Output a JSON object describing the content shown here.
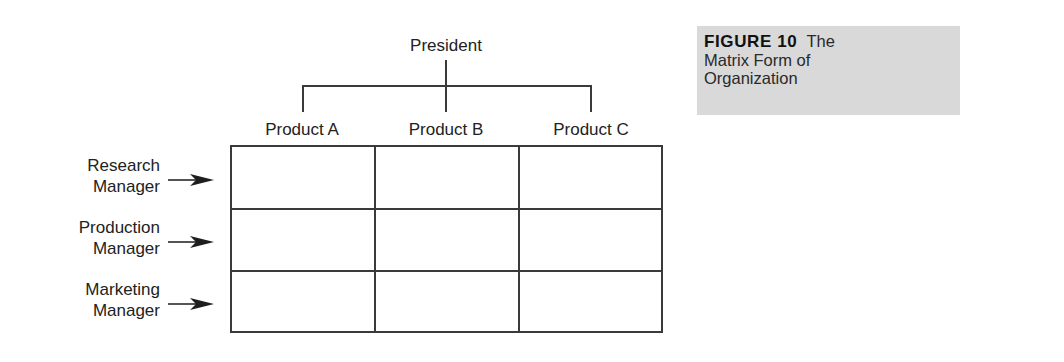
{
  "diagram": {
    "root": "President",
    "columns": [
      "Product A",
      "Product B",
      "Product C"
    ],
    "rows": [
      {
        "line1": "Research",
        "line2": "Manager"
      },
      {
        "line1": "Production",
        "line2": "Manager"
      },
      {
        "line1": "Marketing",
        "line2": "Manager"
      }
    ]
  },
  "caption": {
    "figure_number": "FIGURE 10",
    "title_part1": "The",
    "title_line2": "Matrix Form of",
    "title_line3": "Organization"
  },
  "colors": {
    "line": "#3a3a3a",
    "caption_bg": "#d9d9d9"
  }
}
